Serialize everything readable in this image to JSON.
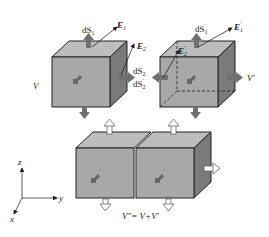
{
  "diagram": {
    "title": "",
    "colors": {
      "front_face": "#a8a8a8",
      "top_face": "#bdbdbd",
      "side_face": "#7a7a7a",
      "edge": "#222222",
      "arrow_dark": "#707070",
      "arrow_light": "#ffffff"
    },
    "top_left_cube": {
      "volume_label": "V",
      "labels": {
        "dS1": "dS",
        "dS1_sub": "1",
        "E1": "E",
        "E1_sub": "1",
        "E2": "E",
        "E2_sub": "2",
        "dS2": "dS",
        "dS2_sub": "2"
      }
    },
    "top_right_cube": {
      "volume_label": "V′",
      "labels": {
        "dS1p": "dS",
        "dS1p_sub": "1",
        "dS1p_prime": "′",
        "E1p": "E",
        "E1p_sub": "1",
        "E1p_prime": "′",
        "E2p": "E",
        "E2p_sub": "2",
        "E2p_prime": "′",
        "dS2p": "dS",
        "dS2p_sub": "2",
        "dS2p_prime": "′"
      }
    },
    "combined": {
      "equation": "V″= V+V′"
    },
    "axes": {
      "z": "z",
      "y": "y",
      "x": "x"
    }
  }
}
